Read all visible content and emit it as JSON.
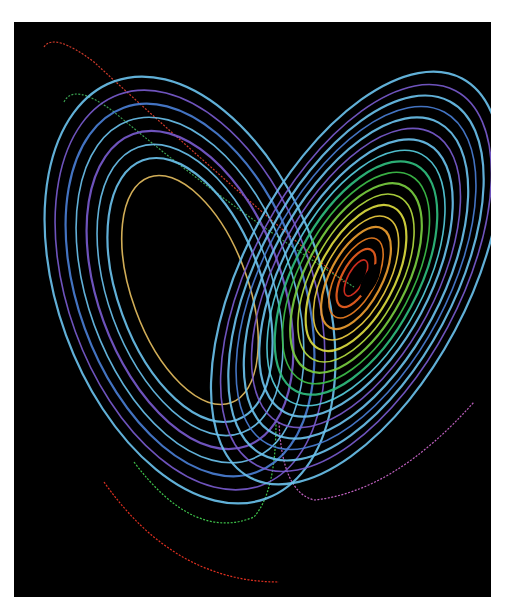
{
  "image": {
    "subject": "Lorenz attractor (butterfly)",
    "background": "#000000",
    "frame": "#ffffff"
  },
  "palette": {
    "outer_blue": "#4a7fd6",
    "light_blue": "#6cc3ee",
    "violet": "#7a5cd0",
    "cyan": "#58d0e0",
    "green": "#3ec24a",
    "yellow_green": "#b8e040",
    "yellow": "#f0d040",
    "orange": "#f08020",
    "red": "#e03020",
    "core": "#000000"
  },
  "left_lobe": {
    "cx": 190,
    "cy": 290,
    "rotate": -20,
    "rings": [
      {
        "rx": 58,
        "ry": 120,
        "color": "#e8c060"
      },
      {
        "rx": 72,
        "ry": 138,
        "color": "#6cc3ee"
      },
      {
        "rx": 82,
        "ry": 152,
        "color": "#6cc3ee"
      },
      {
        "rx": 92,
        "ry": 166,
        "color": "#7a5cd0"
      },
      {
        "rx": 102,
        "ry": 180,
        "color": "#6cc3ee"
      },
      {
        "rx": 112,
        "ry": 194,
        "color": "#4a7fd6"
      },
      {
        "rx": 122,
        "ry": 208,
        "color": "#7a5cd0"
      },
      {
        "rx": 132,
        "ry": 222,
        "color": "#6cc3ee"
      }
    ]
  },
  "right_lobe": {
    "cx": 356,
    "cy": 278,
    "rotate": 28,
    "rings": [
      {
        "rx": 8,
        "ry": 20,
        "color": "#e03020"
      },
      {
        "rx": 14,
        "ry": 32,
        "color": "#f06020"
      },
      {
        "rx": 20,
        "ry": 44,
        "color": "#f08020"
      },
      {
        "rx": 26,
        "ry": 56,
        "color": "#f0a030"
      },
      {
        "rx": 32,
        "ry": 68,
        "color": "#f0d040"
      },
      {
        "rx": 38,
        "ry": 80,
        "color": "#e0e040"
      },
      {
        "rx": 44,
        "ry": 92,
        "color": "#b8e040"
      },
      {
        "rx": 50,
        "ry": 104,
        "color": "#7ad040"
      },
      {
        "rx": 56,
        "ry": 116,
        "color": "#3ec24a"
      },
      {
        "rx": 62,
        "ry": 128,
        "color": "#30c080"
      },
      {
        "rx": 68,
        "ry": 140,
        "color": "#58d0e0"
      },
      {
        "rx": 74,
        "ry": 152,
        "color": "#6cc3ee"
      },
      {
        "rx": 80,
        "ry": 164,
        "color": "#7a5cd0"
      },
      {
        "rx": 86,
        "ry": 176,
        "color": "#6cc3ee"
      },
      {
        "rx": 92,
        "ry": 188,
        "color": "#4a7fd6"
      },
      {
        "rx": 98,
        "ry": 200,
        "color": "#6cc3ee"
      },
      {
        "rx": 104,
        "ry": 212,
        "color": "#7a5cd0"
      },
      {
        "rx": 112,
        "ry": 226,
        "color": "#6cc3ee"
      }
    ]
  },
  "stray_trails": [
    {
      "d": "M 30 25 Q 40 10 80 40 Q 200 150 330 260",
      "color": "#d03a2a"
    },
    {
      "d": "M 50 80 Q 60 60 100 90 Q 220 190 340 265",
      "color": "#3aa050"
    },
    {
      "d": "M 90 460 Q 160 560 265 560",
      "color": "#e03020"
    },
    {
      "d": "M 120 440 Q 180 520 240 495 Q 262 470 262 400",
      "color": "#3ec24a"
    },
    {
      "d": "M 265 400 Q 268 470 300 478 Q 380 470 460 380",
      "color": "#c060c0"
    }
  ]
}
